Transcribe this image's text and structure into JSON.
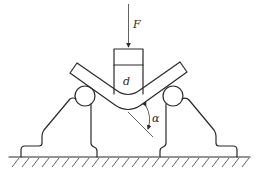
{
  "diagram": {
    "type": "v-bending schematic",
    "labels": {
      "force": "F",
      "punch": "d",
      "angle": "α"
    },
    "components": [
      "force-arrow",
      "punch",
      "bent-plate",
      "left-roller",
      "right-roller",
      "left-support",
      "right-support",
      "ground"
    ],
    "colors": {
      "line": "#2a2a2a",
      "background": "#ffffff"
    }
  }
}
